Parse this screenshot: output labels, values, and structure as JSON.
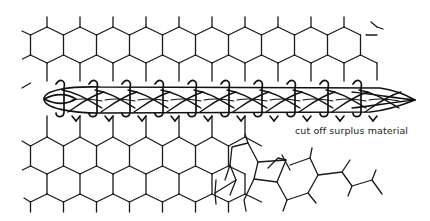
{
  "diagram": {
    "type": "illustration",
    "annotations": [
      {
        "text": "cut off surplus material",
        "x": 295,
        "y": 126
      }
    ],
    "stroke_color": "#1a1a1a",
    "background": "#ffffff"
  }
}
